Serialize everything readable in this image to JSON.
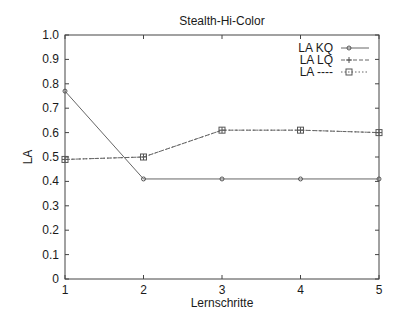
{
  "chart_data": {
    "type": "line",
    "title": "Stealth-Hi-Color",
    "xlabel": "Lernschritte",
    "ylabel": "LA",
    "x": [
      1,
      2,
      3,
      4,
      5
    ],
    "xticks": [
      "1",
      "2",
      "3",
      "4",
      "5"
    ],
    "yticks": [
      "0",
      "0.1",
      "0.2",
      "0.3",
      "0.4",
      "0.5",
      "0.6",
      "0.7",
      "0.8",
      "0.9",
      "1.0"
    ],
    "xlim": [
      1,
      5
    ],
    "ylim": [
      0,
      1.0
    ],
    "grid": false,
    "legend_position": "top-right",
    "series": [
      {
        "name": "LA KQ",
        "values": [
          0.77,
          0.41,
          0.41,
          0.41,
          0.41
        ],
        "style": "solid",
        "marker": "circle"
      },
      {
        "name": "LA LQ",
        "values": [
          0.49,
          0.5,
          0.61,
          0.61,
          0.6
        ],
        "style": "dashed",
        "marker": "plus"
      },
      {
        "name": "LA ----",
        "values": [
          0.49,
          0.5,
          0.61,
          0.61,
          0.6
        ],
        "style": "dotted",
        "marker": "square"
      }
    ]
  }
}
